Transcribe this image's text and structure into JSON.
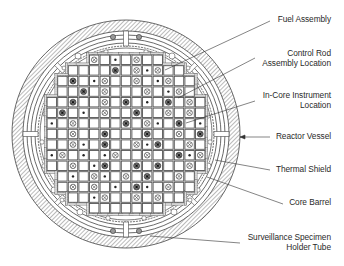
{
  "labels": [
    {
      "id": "fuel-assembly",
      "lines": [
        "Fuel Assembly"
      ]
    },
    {
      "id": "control-rod-assembly-location",
      "lines": [
        "Control Rod",
        "Assembly Location"
      ]
    },
    {
      "id": "in-core-instrument-location",
      "lines": [
        "In-Core Instrument",
        "Location"
      ]
    },
    {
      "id": "reactor-vessel",
      "lines": [
        "Reactor Vessel"
      ]
    },
    {
      "id": "thermal-shield",
      "lines": [
        "Thermal Shield"
      ]
    },
    {
      "id": "core-barrel",
      "lines": [
        "Core Barrel"
      ]
    },
    {
      "id": "surveillance-specimen-holder-tube",
      "lines": [
        "Surveillance Specimen",
        "Holder Tube"
      ]
    }
  ],
  "core": {
    "rows": 15,
    "cols": 15,
    "assembly_count": 193,
    "legend": {
      "C": "control-rod-location",
      "I": "in-core-instrument-location",
      "B": "control-rod-with-instrument",
      ".": "fuel-assembly"
    },
    "map": [
      "....C.I.C......",
      "......B.CIC....",
      "..B.IC..C.IC...",
      "...B.C...C.IC..",
      "..B..C.B.I.B.C.",
      ".B.I.C..B..C.C.",
      "I.C....B.CI.B.I",
      "..C..B...B..C.B",
      "..CI.B..CIB..C.",
      "IC.I.IC..C..BIC",
      "..C.IB..B.B..C.",
      "..I.CI.C.B..C..",
      "..C.C.I.BI.C...",
      "....IC..C.C....",
      "..............."
    ]
  }
}
